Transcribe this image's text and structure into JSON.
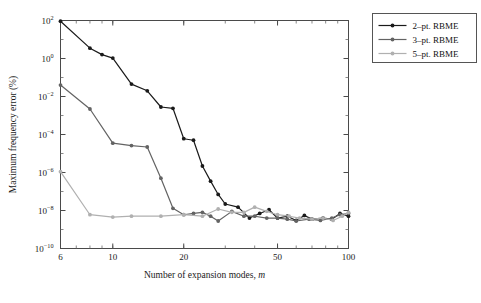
{
  "chart_data": {
    "type": "line",
    "title": "",
    "xlabel": "Number of expansion modes, m",
    "ylabel": "Maximum frequency error (%)",
    "xscale": "log",
    "yscale": "log",
    "xlim": [
      6,
      100
    ],
    "ylim": [
      1e-10,
      100.0
    ],
    "xticks": [
      6,
      10,
      20,
      50,
      100
    ],
    "xticklabels": [
      "6",
      "10",
      "20",
      "50",
      "100"
    ],
    "yticks": [
      1e-10,
      1e-08,
      1e-06,
      0.0001,
      0.01,
      1,
      100
    ],
    "yticklabels": [
      "10-10",
      "10-8",
      "10-6",
      "10-4",
      "10-2",
      "100",
      "102"
    ],
    "grid": false,
    "legend_position": "outside-top-right",
    "series": [
      {
        "name": "2-pt. RBME",
        "color": "#1a1a1a",
        "marker": "circle",
        "x": [
          6,
          8,
          9,
          10,
          12,
          14,
          16,
          18,
          20,
          22,
          24,
          26,
          28,
          30,
          34,
          38,
          42,
          46,
          50,
          55,
          60,
          65,
          70,
          78,
          85,
          92,
          100
        ],
        "y": [
          92,
          3.5,
          1.6,
          1.05,
          0.045,
          0.02,
          0.0028,
          0.0024,
          6e-05,
          5e-05,
          2.2e-06,
          3.5e-07,
          7e-08,
          2.2e-08,
          1.5e-08,
          4e-09,
          7e-09,
          1.1e-08,
          4e-09,
          5e-09,
          3e-09,
          5.5e-09,
          3.5e-09,
          4e-09,
          3.5e-09,
          7e-09,
          5e-09
        ]
      },
      {
        "name": "3-pt. RBME",
        "color": "#636363",
        "marker": "circle",
        "x": [
          6,
          8,
          10,
          12,
          14,
          16,
          18,
          20,
          22,
          24,
          26,
          28,
          32,
          36,
          40,
          45,
          50,
          55,
          60,
          68,
          76,
          85,
          92,
          100
        ],
        "y": [
          0.04,
          0.0022,
          3.5e-05,
          2.6e-05,
          2.2e-05,
          5e-07,
          1.3e-08,
          6e-09,
          7e-09,
          8e-09,
          5e-09,
          2.8e-09,
          9e-09,
          5e-09,
          5e-09,
          4e-09,
          4e-09,
          3.5e-09,
          2.8e-09,
          3.5e-09,
          3e-09,
          4e-09,
          6e-09,
          7e-09
        ]
      },
      {
        "name": "5-pt. RBME",
        "color": "#b0b0b0",
        "marker": "circle",
        "x": [
          6,
          8,
          10,
          12,
          16,
          20,
          24,
          28,
          32,
          36,
          40,
          45,
          50,
          56,
          62,
          70,
          78,
          86,
          94,
          100
        ],
        "y": [
          1.1e-06,
          6e-09,
          4.5e-09,
          5e-09,
          5e-09,
          6e-09,
          5e-09,
          1.2e-08,
          8e-09,
          8e-09,
          1.5e-08,
          9e-09,
          6e-09,
          5e-09,
          4e-09,
          3.5e-09,
          4e-09,
          3e-09,
          5e-09,
          8e-09
        ]
      }
    ],
    "legend_entries": [
      "2-pt. RBME",
      "3-pt. RBME",
      "5-pt. RBME"
    ]
  }
}
